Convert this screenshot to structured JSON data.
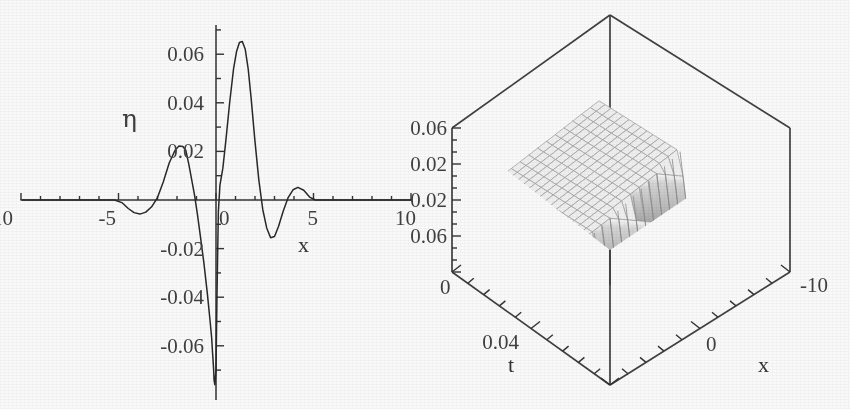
{
  "figure": {
    "background_color": "#ffffff",
    "ink_color": "#2b2b2b",
    "panels": [
      "plot-2d-wave-profile",
      "plot-3d-surface"
    ]
  },
  "chart_data": [
    {
      "type": "line",
      "id": "eta-vs-x-profile",
      "title": "",
      "xlabel": "x",
      "ylabel": "η",
      "xlim": [
        -10,
        10
      ],
      "ylim": [
        -0.08,
        0.07
      ],
      "grid": false,
      "legend": null,
      "xticks": [
        -10,
        -5,
        0,
        5,
        10
      ],
      "xticklabels": [
        "-10",
        "-5",
        "0",
        "5",
        "10"
      ],
      "yticks": [
        0.06,
        0.04,
        0.02,
        -0.02,
        -0.04,
        -0.06
      ],
      "yticklabels": [
        "0.06",
        "0.04",
        "0.02",
        "-0.02",
        "-0.04",
        "-0.06"
      ],
      "minor_tick_spacing_x": 1,
      "minor_tick_spacing_y": 0.01,
      "series": [
        {
          "name": "η(x)",
          "color": "#222222",
          "note": "oscillatory wave packet with sharp discontinuity near x = -0.2",
          "x": [
            -10.0,
            -9.0,
            -8.0,
            -7.0,
            -6.0,
            -5.2,
            -4.8,
            -4.5,
            -4.2,
            -3.9,
            -3.6,
            -3.3,
            -3.0,
            -2.7,
            -2.4,
            -2.1,
            -1.9,
            -1.7,
            -1.55,
            -1.4,
            -1.25,
            -1.1,
            -0.95,
            -0.8,
            -0.62,
            -0.45,
            -0.3,
            -0.22,
            -0.18,
            -0.15,
            -0.12,
            -0.1,
            -0.06,
            0.0,
            0.05,
            0.12,
            0.2,
            0.35,
            0.5,
            0.7,
            0.9,
            1.05,
            1.2,
            1.35,
            1.5,
            1.65,
            1.8,
            2.0,
            2.2,
            2.4,
            2.6,
            2.8,
            3.0,
            3.2,
            3.45,
            3.7,
            3.95,
            4.2,
            4.5,
            4.8,
            5.1,
            5.5,
            6.0,
            7.0,
            8.0,
            9.0,
            10.0
          ],
          "y": [
            0.0,
            0.0,
            0.0,
            0.0,
            0.0,
            0.0,
            -0.0012,
            -0.0035,
            -0.0052,
            -0.0058,
            -0.005,
            -0.0028,
            0.001,
            0.0075,
            0.0152,
            0.0205,
            0.0222,
            0.022,
            0.0205,
            0.015,
            0.0085,
            0.002,
            -0.006,
            -0.015,
            -0.026,
            -0.038,
            -0.05,
            -0.057,
            -0.0625,
            -0.066,
            -0.07,
            -0.074,
            -0.076,
            -0.07,
            -0.04,
            -0.005,
            0.006,
            0.013,
            0.024,
            0.04,
            0.054,
            0.061,
            0.0648,
            0.0652,
            0.062,
            0.054,
            0.042,
            0.024,
            0.008,
            -0.004,
            -0.0115,
            -0.0155,
            -0.015,
            -0.011,
            -0.0045,
            0.001,
            0.0042,
            0.0052,
            0.004,
            0.0012,
            0.0,
            0.0,
            0.0,
            0.0,
            0.0,
            0.0,
            0.0
          ],
          "peaks": [
            {
              "x": 1.3,
              "y": 0.065,
              "label": "main crest"
            },
            {
              "x": -1.8,
              "y": 0.022,
              "label": "secondary crest"
            },
            {
              "x": -0.1,
              "y": -0.076,
              "label": "sharp trough"
            },
            {
              "x": 2.8,
              "y": -0.0155,
              "label": "trailing trough"
            },
            {
              "x": 4.2,
              "y": 0.0052,
              "label": "trailing crest"
            }
          ]
        }
      ]
    },
    {
      "type": "surface",
      "id": "eta-surface-x-t",
      "title": "",
      "xlabel": "x",
      "ylabel": "t",
      "zlabel": "",
      "grid": true,
      "legend": null,
      "projection": "3d-box",
      "xticks": [
        -10,
        0
      ],
      "xticklabels": [
        "-10",
        "0"
      ],
      "yticks": [
        0,
        0.04
      ],
      "yticklabels": [
        "0",
        "0.04"
      ],
      "zticks": [
        0.06,
        0.02,
        -0.02,
        -0.06
      ],
      "zticklabels": [
        "0.06",
        "0.02",
        "0.02",
        "0.06"
      ],
      "zticklabels_true": [
        "0.06",
        "0.02",
        "-0.02",
        "-0.06"
      ],
      "xlim": [
        -10,
        0
      ],
      "ylim": [
        0,
        0.05
      ],
      "zlim": [
        -0.08,
        0.08
      ],
      "description": "wireframe mesh surface η(x,t) with a steep near-vertical shock wall running across the domain; flat mesh plateau on either side",
      "surface_color": "#f2f2f2",
      "mesh_color": "#9b9b9b",
      "wall_color": "#8a8a8a"
    }
  ]
}
